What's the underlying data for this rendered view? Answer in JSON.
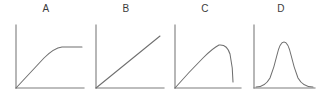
{
  "figure": {
    "background_color": "#ffffff",
    "axis_color": "#7c7c7c",
    "curve_color": "#6f6f6f",
    "label_color": "#3b3b3b",
    "panel_count": 4
  },
  "panels": [
    {
      "label": "A",
      "curve_name": "saturating-rise-plateau",
      "description": "Line rises linearly from the origin then bends and flattens into a horizontal plateau",
      "x_offset": 4,
      "width": 84,
      "axis": {
        "x": 12,
        "y_top": 5,
        "y_base": 68,
        "x_end": 80
      },
      "curve_path": "M 12 68 L 40 38 Q 50 28 58 27 L 78 27"
    },
    {
      "label": "B",
      "curve_name": "linear-increase",
      "description": "Straight diagonal line increasing from the origin",
      "x_offset": 84,
      "width": 84,
      "axis": {
        "x": 12,
        "y_top": 5,
        "y_base": 68,
        "x_end": 80
      },
      "curve_path": "M 12 68 L 76 16"
    },
    {
      "label": "C",
      "curve_name": "rise-peak-sharp-fall",
      "description": "Curve rises from the origin to a broad peak then drops steeply near the right edge",
      "x_offset": 163,
      "width": 84,
      "axis": {
        "x": 12,
        "y_top": 5,
        "y_base": 68,
        "x_end": 78
      },
      "curve_path": "M 12 68 Q 26 52 40 38 Q 50 28 56 25 Q 64 24 67 34 Q 70 48 70 62"
    },
    {
      "label": "D",
      "curve_name": "bell-curve-normal-distribution",
      "description": "Symmetric bell-shaped curve rising from and returning to the baseline",
      "x_offset": 243,
      "width": 76,
      "axis": {
        "x": 11,
        "y_top": 5,
        "y_base": 68,
        "x_end": 72
      },
      "curve_path": "M 13 67 Q 22 67 27 58 Q 31 48 34 35 Q 37 22 41 22 Q 45 22 48 35 Q 51 48 55 58 Q 60 67 70 67"
    }
  ]
}
